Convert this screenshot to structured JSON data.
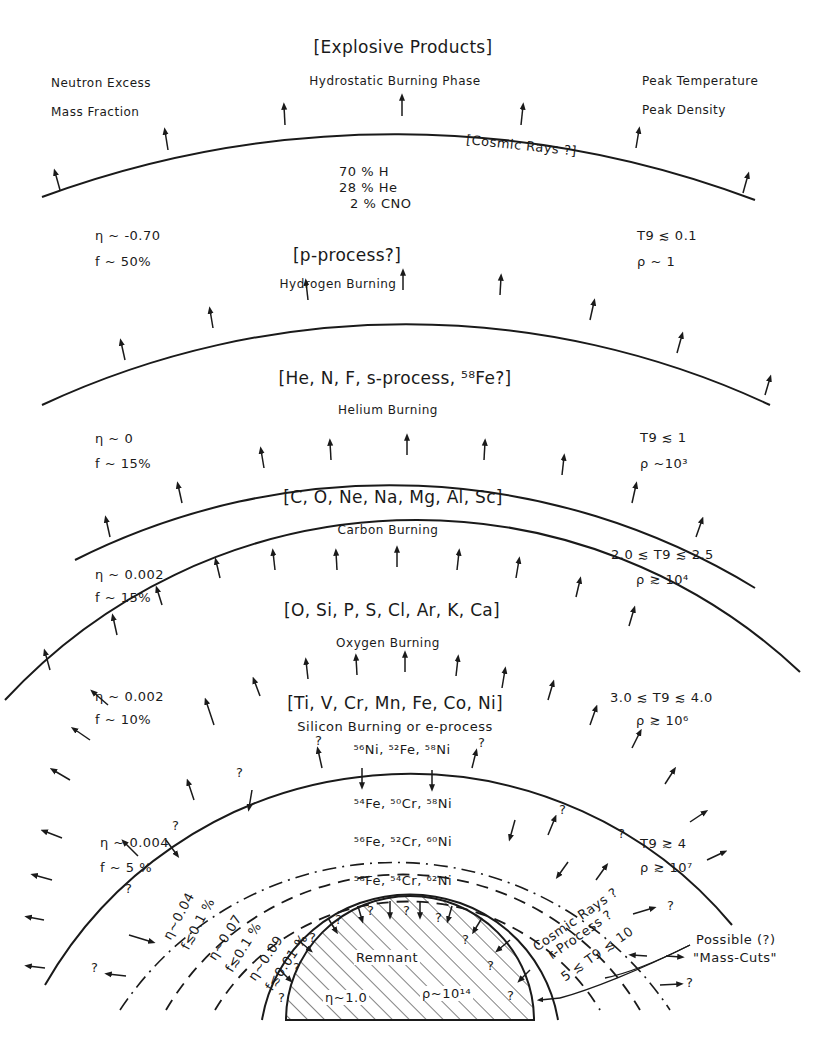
{
  "header": {
    "left_col": [
      "Neutron Excess",
      "Mass Fraction"
    ],
    "center_col": [
      "[Explosive Products]",
      "Hydrostatic Burning Phase"
    ],
    "right_col": [
      "Peak Temperature",
      "Peak Density"
    ]
  },
  "zones": [
    {
      "name": "outer-envelope",
      "annotation": "[Cosmic Rays ?]",
      "composition": [
        "70 %  H",
        "28 %  He",
        "2 %  CNO"
      ],
      "eta": "η ~ -0.70",
      "f": "f ~ 50%",
      "T9": "T9 ≲ 0.1",
      "rho": "ρ ~ 1"
    },
    {
      "name": "hydrogen-burning",
      "products": "[p-process?]",
      "phase": "Hydrogen Burning",
      "eta": "η ~ 0",
      "f": "f ~ 15%",
      "T9": "T9 ≲ 1",
      "rho": "ρ ~10³"
    },
    {
      "name": "helium-burning",
      "products": "[He, N, F, s-process, ⁵⁸Fe?]",
      "phase": "Helium Burning",
      "eta": "η ~ 0.002",
      "f": "f ~ 15%",
      "T9": "2.0 ≲ T9 ≲ 2.5",
      "rho": "ρ ≳ 10⁴"
    },
    {
      "name": "carbon-burning",
      "products": "[C, O, Ne, Na, Mg, Al, Sc]",
      "phase": "Carbon Burning",
      "eta": "η ~ 0.002",
      "f": "f ~ 10%",
      "T9": "3.0 ≲ T9 ≲ 4.0",
      "rho": "ρ ≳ 10⁶"
    },
    {
      "name": "oxygen-burning",
      "products": "[O, Si, P, S, Cl, Ar, K, Ca]",
      "phase": "Oxygen Burning"
    },
    {
      "name": "silicon-burning",
      "products": "[Ti, V, Cr, Mn, Fe, Co, Ni]",
      "phase": "Silicon Burning or e-process",
      "eta": "η ~ 0.004",
      "f": "f ~ 5 %",
      "T9": "T9 ≳ 4",
      "rho": "ρ ≳ 10⁷"
    }
  ],
  "inner_shells": [
    {
      "isotopes": "⁵⁶Ni, ⁵²Fe, ⁵⁸Ni"
    },
    {
      "isotopes": "⁵⁴Fe, ⁵⁰Cr, ⁵⁸Ni",
      "eta": "η~0.04",
      "f": "f≲0.1 %"
    },
    {
      "isotopes": "⁵⁶Fe, ⁵²Cr, ⁶⁰Ni",
      "eta": "η~0.07",
      "f": "f≲0.1 %"
    },
    {
      "isotopes": "⁵⁸Fe, ⁵⁴Cr, ⁶²Ni",
      "eta": "η~0.09",
      "f": "f≲0.01 %"
    }
  ],
  "core": {
    "label": "Remnant",
    "eta": "η~1.0",
    "rho": "ρ~10¹⁴",
    "shell_marks": [
      "?",
      "?",
      "?",
      "?",
      "?",
      "?",
      "?",
      "?",
      "?",
      "?"
    ]
  },
  "inner_annotation": {
    "products": [
      "Cosmic Rays ?",
      "r-Process ?"
    ],
    "T9": "5 ≲ T9 ≲ 10"
  },
  "mass_cuts": [
    "Possible (?)",
    "\"Mass-Cuts\""
  ],
  "question_mark": "?"
}
